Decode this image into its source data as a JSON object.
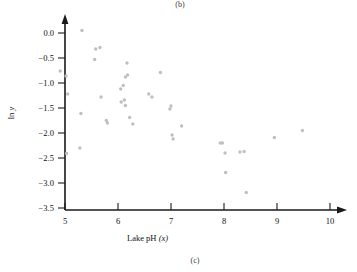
{
  "figure": {
    "panel_label_top": "(b)",
    "panel_label_bottom": "(c)"
  },
  "chart_data": {
    "type": "scatter",
    "title": "",
    "subtitle": "",
    "xlabel": "Lake pH (x)",
    "ylabel": "ln y",
    "xlim": [
      4.6,
      10.3
    ],
    "ylim": [
      -3.72,
      0.25
    ],
    "xticks": [
      5,
      6,
      7,
      8,
      9,
      10
    ],
    "xticklabels": [
      "5",
      "6",
      "7",
      "8",
      "9",
      "10"
    ],
    "yticks": [
      0.0,
      -0.5,
      -1.0,
      -1.5,
      -2.0,
      -2.5,
      -3.0,
      -3.5
    ],
    "yticklabels": [
      "0.0",
      "-0.5",
      "-1.0",
      "-1.5",
      "-2.0",
      "-2.5",
      "-3.0",
      "-3.5"
    ],
    "grid": false,
    "legend": false,
    "marker": "circle",
    "marker_color": "#bfbfbf",
    "marker_size": 3.4,
    "axis_color": "#1a1a1a",
    "n_points": 44,
    "points": [
      {
        "x": 4.91,
        "y": -0.76
      },
      {
        "x": 5.02,
        "y": -0.86
      },
      {
        "x": 5.05,
        "y": -1.22
      },
      {
        "x": 5.03,
        "y": -2.41
      },
      {
        "x": 5.32,
        "y": 0.05
      },
      {
        "x": 5.3,
        "y": -1.61
      },
      {
        "x": 5.28,
        "y": -2.3
      },
      {
        "x": 5.56,
        "y": -0.53
      },
      {
        "x": 5.58,
        "y": -0.32
      },
      {
        "x": 5.66,
        "y": -0.29
      },
      {
        "x": 5.68,
        "y": -1.28
      },
      {
        "x": 5.78,
        "y": -1.75
      },
      {
        "x": 5.8,
        "y": -1.8
      },
      {
        "x": 6.05,
        "y": -1.12
      },
      {
        "x": 6.06,
        "y": -1.38
      },
      {
        "x": 6.1,
        "y": -1.05
      },
      {
        "x": 6.12,
        "y": -1.34
      },
      {
        "x": 6.14,
        "y": -0.88
      },
      {
        "x": 6.17,
        "y": -0.6
      },
      {
        "x": 6.18,
        "y": -0.84
      },
      {
        "x": 6.14,
        "y": -1.45
      },
      {
        "x": 6.22,
        "y": -1.69
      },
      {
        "x": 6.28,
        "y": -1.82
      },
      {
        "x": 6.58,
        "y": -1.22
      },
      {
        "x": 6.64,
        "y": -1.28
      },
      {
        "x": 6.8,
        "y": -0.79
      },
      {
        "x": 6.98,
        "y": -1.52
      },
      {
        "x": 7.0,
        "y": -1.46
      },
      {
        "x": 7.02,
        "y": -2.04
      },
      {
        "x": 7.04,
        "y": -2.12
      },
      {
        "x": 7.2,
        "y": -1.86
      },
      {
        "x": 7.93,
        "y": -2.2
      },
      {
        "x": 7.97,
        "y": -2.2
      },
      {
        "x": 8.02,
        "y": -2.4
      },
      {
        "x": 8.03,
        "y": -2.79
      },
      {
        "x": 8.3,
        "y": -2.38
      },
      {
        "x": 8.38,
        "y": -2.37
      },
      {
        "x": 8.42,
        "y": -3.19
      },
      {
        "x": 8.95,
        "y": -2.09
      },
      {
        "x": 9.48,
        "y": -1.95
      }
    ]
  }
}
